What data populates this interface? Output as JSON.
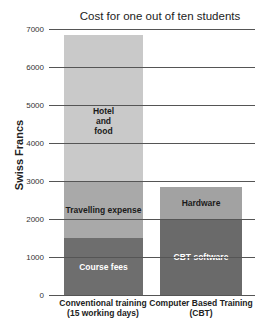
{
  "chart_data": {
    "type": "bar",
    "stacked": true,
    "title": "Cost for one out of ten students",
    "xlabel": "",
    "ylabel": "Swiss Francs",
    "ylim": [
      0,
      7000
    ],
    "yticks": [
      0,
      1000,
      2000,
      3000,
      4000,
      5000,
      6000,
      7000
    ],
    "grid": true,
    "legend": "inline segment labels",
    "categories": [
      "Conventional training\n(15 working days)",
      "Computer Based Training\n(CBT)"
    ],
    "series": [
      {
        "name": "Course fees",
        "values": [
          1500,
          0
        ],
        "color": "#6e6e6e"
      },
      {
        "name": "Travelling expense",
        "values": [
          1500,
          0
        ],
        "color": "#a9a9a9"
      },
      {
        "name": "Hotel and food",
        "values": [
          3850,
          0
        ],
        "color": "#c9c9c9"
      },
      {
        "name": "CBT software",
        "values": [
          0,
          2000
        ],
        "color": "#6a6a6a"
      },
      {
        "name": "Hardware",
        "values": [
          0,
          850
        ],
        "color": "#a2a2a2"
      }
    ],
    "totals": [
      6850,
      2850
    ]
  },
  "title": "Cost for one out of ten students",
  "ylabel": "Swiss Francs",
  "yticks": [
    "7000",
    "6000",
    "5000",
    "4000",
    "3000",
    "2000",
    "1000",
    "0"
  ],
  "bars": [
    {
      "label_line1": "Conventional training",
      "label_line2": "(15 working days)",
      "segments": [
        {
          "label": "Course fees",
          "value": 1500,
          "color": "#6e6e6e",
          "text_color": "#ffffff"
        },
        {
          "label": "Travelling expense",
          "value": 1500,
          "color": "#a9a9a9",
          "text_color": "#1a1a1a"
        },
        {
          "label": "Hotel and food",
          "value": 3850,
          "color": "#c9c9c9",
          "text_color": "#1a1a1a"
        }
      ]
    },
    {
      "label_line1": "Computer Based Training",
      "label_line2": "(CBT)",
      "segments": [
        {
          "label": "CBT software",
          "value": 2000,
          "color": "#6a6a6a",
          "text_color": "#ffffff"
        },
        {
          "label": "Hardware",
          "value": 850,
          "color": "#a2a2a2",
          "text_color": "#1a1a1a"
        }
      ]
    }
  ]
}
